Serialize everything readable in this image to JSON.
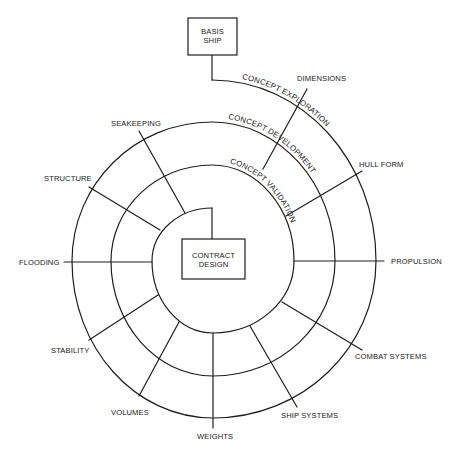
{
  "diagram": {
    "type": "design spiral",
    "start_box": {
      "line1": "BASIS",
      "line2": "SHIP"
    },
    "end_box": {
      "line1": "CONTRACT",
      "line2": "DESIGN"
    },
    "rings": [
      {
        "label": "CONCEPT EXPLORATION",
        "level": "outer"
      },
      {
        "label": "CONCEPT DEVELOPMENT",
        "level": "middle"
      },
      {
        "label": "CONCEPT VALIDATION",
        "level": "inner"
      }
    ],
    "spokes": [
      {
        "label": "DIMENSIONS"
      },
      {
        "label": "HULL FORM"
      },
      {
        "label": "PROPULSION"
      },
      {
        "label": "COMBAT SYSTEMS"
      },
      {
        "label": "SHIP SYSTEMS"
      },
      {
        "label": "WEIGHTS"
      },
      {
        "label": "VOLUMES"
      },
      {
        "label": "STABILITY"
      },
      {
        "label": "FLOODING"
      },
      {
        "label": "STRUCTURE"
      },
      {
        "label": "SEAKEEPING"
      }
    ],
    "colors": {
      "line": "#1e1e1e",
      "text": "#222222",
      "background": "#ffffff"
    }
  }
}
